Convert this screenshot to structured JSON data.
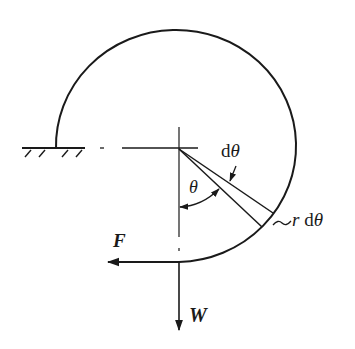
{
  "diagram": {
    "type": "mechanics free-body diagram",
    "colors": {
      "ink": "#1a1a1a",
      "background": "#ffffff"
    },
    "labels": {
      "force_f": "F",
      "weight_w": "W",
      "theta": "θ",
      "d_theta": "dθ",
      "d_theta_prefix": "d",
      "d_theta_symbol": "θ",
      "r_d_theta_tilde": "~",
      "r_d_theta_r": "r",
      "r_d_theta_d": "d",
      "r_d_theta_symbol": "θ"
    },
    "geometry": {
      "center": [
        179,
        149
      ],
      "arc_start": [
        56,
        149
      ],
      "arc_end": [
        179,
        262
      ],
      "arc_sweep_degrees": 270,
      "ground_line": {
        "x1": 22,
        "x2": 85,
        "y": 148
      },
      "hatch_marks": 4,
      "element_angle_theta_deg": 47,
      "element_angle_d_theta_deg": 9
    }
  }
}
